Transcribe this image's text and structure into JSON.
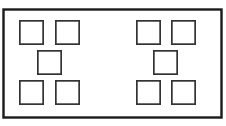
{
  "diagram": {
    "type": "line-diagram",
    "canvas": {
      "width": 226,
      "height": 126,
      "background": "#ffffff"
    },
    "outer_rectangle": {
      "label": "outer-frame",
      "x": 3.5,
      "y": 9.5,
      "width": 218,
      "height": 108,
      "stroke": "#1a1a1a",
      "stroke_width": 2.4,
      "fill": "#ffffff"
    },
    "square_style": {
      "stroke": "#333333",
      "stroke_width": 1.7,
      "fill": "#ffffff",
      "size": 25
    },
    "groups": [
      {
        "name": "left-group",
        "pattern": "quincunx",
        "count": 5,
        "squares": [
          {
            "label": "left-top-left",
            "x": 19,
            "y": 20,
            "size": 25
          },
          {
            "label": "left-top-right",
            "x": 55,
            "y": 20,
            "size": 25
          },
          {
            "label": "left-center",
            "x": 37,
            "y": 50,
            "size": 25
          },
          {
            "label": "left-bottom-left",
            "x": 19,
            "y": 80,
            "size": 25
          },
          {
            "label": "left-bottom-right",
            "x": 55,
            "y": 80,
            "size": 25
          }
        ]
      },
      {
        "name": "right-group",
        "pattern": "quincunx",
        "count": 5,
        "squares": [
          {
            "label": "right-top-left",
            "x": 136,
            "y": 20,
            "size": 25
          },
          {
            "label": "right-top-right",
            "x": 171,
            "y": 20,
            "size": 25
          },
          {
            "label": "right-center",
            "x": 153,
            "y": 50,
            "size": 25
          },
          {
            "label": "right-bottom-left",
            "x": 136,
            "y": 80,
            "size": 25
          },
          {
            "label": "right-bottom-right",
            "x": 171,
            "y": 80,
            "size": 25
          }
        ]
      }
    ]
  }
}
